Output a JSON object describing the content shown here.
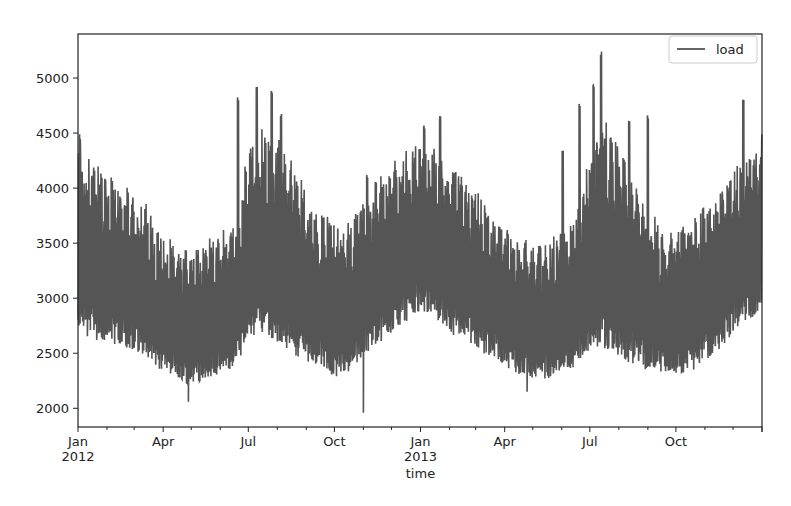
{
  "chart_data": {
    "type": "line",
    "title": "",
    "xlabel": "time",
    "ylabel": "",
    "ylim": [
      1830,
      5400
    ],
    "xlim": [
      "2012-01-01",
      "2013-12-31"
    ],
    "grid": false,
    "legend": {
      "position": "upper right",
      "entries": [
        "load"
      ]
    },
    "series": [
      {
        "name": "load",
        "color": "#555555",
        "description": "Hourly electricity load, dense daily oscillation between lower and upper envelope",
        "envelope": {
          "x": [
            "2012-01-01",
            "2012-01-15",
            "2012-02-01",
            "2012-02-15",
            "2012-03-01",
            "2012-03-15",
            "2012-04-01",
            "2012-04-15",
            "2012-05-01",
            "2012-05-15",
            "2012-06-01",
            "2012-06-15",
            "2012-07-01",
            "2012-07-15",
            "2012-08-01",
            "2012-08-15",
            "2012-09-01",
            "2012-09-15",
            "2012-10-01",
            "2012-10-15",
            "2012-11-01",
            "2012-11-15",
            "2012-12-01",
            "2012-12-15",
            "2013-01-01",
            "2013-01-15",
            "2013-02-01",
            "2013-02-15",
            "2013-03-01",
            "2013-03-15",
            "2013-04-01",
            "2013-04-15",
            "2013-05-01",
            "2013-05-15",
            "2013-06-01",
            "2013-06-15",
            "2013-07-01",
            "2013-07-15",
            "2013-08-01",
            "2013-08-15",
            "2013-09-01",
            "2013-09-15",
            "2013-10-01",
            "2013-10-15",
            "2013-11-01",
            "2013-11-15",
            "2013-12-01",
            "2013-12-15",
            "2013-12-31"
          ],
          "upper": [
            4450,
            4300,
            4100,
            4000,
            3950,
            3800,
            3550,
            3450,
            3450,
            3500,
            3550,
            3650,
            4300,
            4550,
            4450,
            4300,
            3950,
            3750,
            3700,
            3650,
            3900,
            4100,
            4200,
            4300,
            4400,
            4350,
            4200,
            4100,
            3950,
            3800,
            3650,
            3550,
            3500,
            3500,
            3600,
            3700,
            4300,
            4600,
            4400,
            4200,
            3750,
            3650,
            3650,
            3700,
            3850,
            3950,
            4150,
            4300,
            4450
          ],
          "lower": [
            2600,
            2550,
            2500,
            2500,
            2450,
            2400,
            2250,
            2200,
            2150,
            2200,
            2250,
            2300,
            2500,
            2600,
            2500,
            2400,
            2350,
            2300,
            2200,
            2250,
            2400,
            2500,
            2600,
            2700,
            2800,
            2750,
            2600,
            2550,
            2450,
            2400,
            2300,
            2250,
            2200,
            2200,
            2250,
            2300,
            2450,
            2400,
            2350,
            2300,
            2250,
            2250,
            2250,
            2250,
            2350,
            2450,
            2600,
            2700,
            2800
          ]
        },
        "spikes": [
          {
            "x": "2012-01-03",
            "value": 4500
          },
          {
            "x": "2012-06-20",
            "value": 4850
          },
          {
            "x": "2012-07-10",
            "value": 4920
          },
          {
            "x": "2012-07-26",
            "value": 4920
          },
          {
            "x": "2012-08-05",
            "value": 4700
          },
          {
            "x": "2012-11-05",
            "value": 4150
          },
          {
            "x": "2013-01-22",
            "value": 4670
          },
          {
            "x": "2013-01-05",
            "value": 4570
          },
          {
            "x": "2013-06-02",
            "value": 4350
          },
          {
            "x": "2013-06-20",
            "value": 4800
          },
          {
            "x": "2013-07-05",
            "value": 4950
          },
          {
            "x": "2013-07-13",
            "value": 5250
          },
          {
            "x": "2013-08-12",
            "value": 4650
          },
          {
            "x": "2013-09-01",
            "value": 4660
          },
          {
            "x": "2013-12-12",
            "value": 4820
          }
        ],
        "dips": [
          {
            "x": "2012-03-20",
            "value": 2450
          },
          {
            "x": "2012-04-28",
            "value": 2060
          },
          {
            "x": "2012-11-01",
            "value": 1960
          },
          {
            "x": "2013-04-25",
            "value": 2150
          }
        ],
        "summary": {
          "min": 1960,
          "max": 5250
        }
      }
    ],
    "y_ticks": [
      2000,
      2500,
      3000,
      3500,
      4000,
      4500,
      5000
    ],
    "x_ticks": [
      {
        "date": "2012-01-01",
        "label": "Jan",
        "sublabel": "2012"
      },
      {
        "date": "2012-04-01",
        "label": "Apr",
        "sublabel": ""
      },
      {
        "date": "2012-07-01",
        "label": "Jul",
        "sublabel": ""
      },
      {
        "date": "2012-10-01",
        "label": "Oct",
        "sublabel": ""
      },
      {
        "date": "2013-01-01",
        "label": "Jan",
        "sublabel": "2013"
      },
      {
        "date": "2013-04-01",
        "label": "Apr",
        "sublabel": ""
      },
      {
        "date": "2013-07-01",
        "label": "Jul",
        "sublabel": ""
      },
      {
        "date": "2013-10-01",
        "label": "Oct",
        "sublabel": ""
      }
    ]
  },
  "layout": {
    "plot": {
      "left": 78,
      "top": 34,
      "right": 762,
      "bottom": 427
    }
  }
}
